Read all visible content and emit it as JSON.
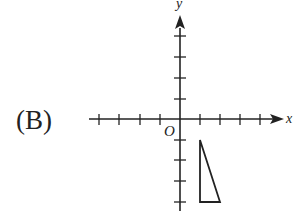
{
  "option_label": "(B)",
  "axes": {
    "x_label": "x",
    "y_label": "y",
    "origin_label": "O",
    "x_ticks": [
      -4,
      -3,
      -2,
      -1,
      1,
      2,
      3,
      4
    ],
    "y_ticks": [
      4,
      3,
      2,
      1,
      -1,
      -2,
      -3,
      -4
    ]
  },
  "triangle": {
    "vertices": [
      [
        1,
        -1
      ],
      [
        1,
        -4
      ],
      [
        2,
        -4
      ]
    ],
    "description": "right triangle with vertical leg on x=1 from y=-1 to y=-4 and horizontal leg on y=-4 from x=1 to x=2"
  },
  "colors": {
    "stroke": "#222222",
    "background": "#ffffff"
  }
}
